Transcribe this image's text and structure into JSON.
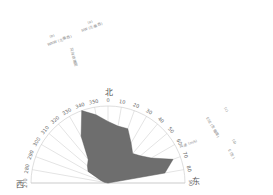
{
  "chart_data": {
    "type": "polar-area",
    "title": "",
    "directions": {
      "north": "北",
      "west": "西",
      "east": "东"
    },
    "angle_range": [
      270,
      90
    ],
    "angles": [
      270,
      280,
      290,
      300,
      310,
      320,
      330,
      340,
      350,
      0,
      10,
      20,
      30,
      40,
      50,
      60,
      70,
      80,
      90
    ],
    "angle_labels": [
      "270",
      "280",
      "290",
      "300",
      "310",
      "320",
      "330",
      "340",
      "350",
      "0",
      "10",
      "20",
      "30",
      "40",
      "50",
      "60",
      "70",
      "80",
      "90"
    ],
    "values": [
      0.0,
      0.05,
      0.1,
      0.3,
      0.35,
      0.4,
      0.7,
      1.0,
      0.9,
      0.8,
      0.75,
      0.75,
      0.6,
      0.5,
      0.55,
      0.65,
      0.9,
      0.75,
      0.0
    ],
    "rlim": [
      0,
      1
    ],
    "fill_color": "#6e6e6e",
    "grid_color": "#c8c8c8",
    "annotations_left": [
      "(a)",
      "NW (北偏西)",
      "风向玫瑰图",
      "(b)",
      "WNW (北偏西)"
    ],
    "annotations_right": [
      "(c)",
      "ESE (东偏南)",
      "风速 (m/s)",
      "(d)",
      "E (东)"
    ]
  }
}
